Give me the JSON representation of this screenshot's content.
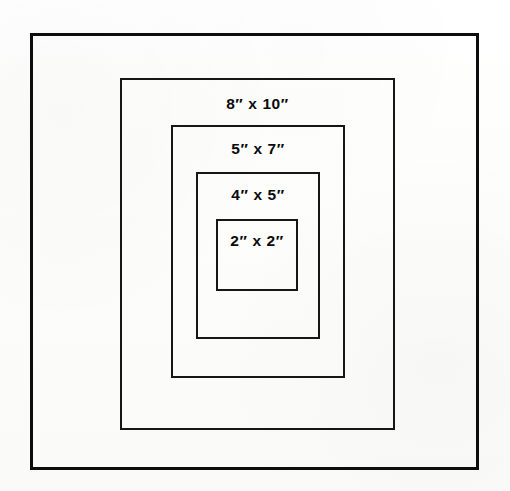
{
  "diagram": {
    "background_color": "#fdfdfc",
    "line_color": "#161616",
    "frame_line_color": "#0d0d0d",
    "text_color": "#0a0a0a",
    "outer_frame": {
      "name": "outer board edge",
      "x": 30,
      "y": 33,
      "width": 449,
      "height": 437,
      "stroke_width": 3
    },
    "openings": [
      {
        "label": "8″ x 10″",
        "size": "8 x 10",
        "width_in": 8,
        "height_in": 10,
        "x": 120,
        "y": 78,
        "width": 275,
        "height": 352,
        "stroke_width": 2,
        "label_top_offset": 16
      },
      {
        "label": "5″ x 7″",
        "size": "5 x 7",
        "width_in": 5,
        "height_in": 7,
        "x": 171,
        "y": 125,
        "width": 174,
        "height": 253,
        "stroke_width": 2,
        "label_top_offset": 14
      },
      {
        "label": "4″ x 5″",
        "size": "4 x 5",
        "width_in": 4,
        "height_in": 5,
        "x": 196,
        "y": 172,
        "width": 124,
        "height": 167,
        "stroke_width": 2,
        "label_top_offset": 13
      },
      {
        "label": "2″ x 2″",
        "size": "2 x 2",
        "width_in": 2,
        "height_in": 2,
        "x": 216,
        "y": 219,
        "width": 82,
        "height": 72,
        "stroke_width": 2,
        "label_top_offset": 12
      }
    ]
  }
}
